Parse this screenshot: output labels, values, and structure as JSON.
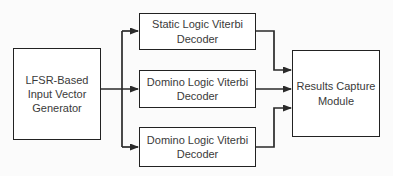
{
  "diagram": {
    "background_color": "#fbfbfb",
    "line_color": "#2a2a2a",
    "text_color": "#3a3a3a",
    "box_fill": "#ffffff",
    "blocks": {
      "generator": {
        "label": "LFSR-Based\nInput Vector\nGenerator"
      },
      "static_decoder": {
        "label": "Static Logic Viterbi\nDecoder"
      },
      "domino_decoder_1": {
        "label": "Domino Logic Viterbi\nDecoder"
      },
      "domino_decoder_2": {
        "label": "Domino Logic Viterbi\nDecoder"
      },
      "results_capture": {
        "label": "Results Capture\nModule"
      }
    }
  }
}
